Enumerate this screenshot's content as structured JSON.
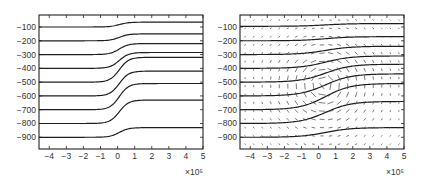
{
  "chart_data": [
    {
      "type": "line",
      "title": "",
      "xlabel": "",
      "ylabel": "",
      "x_exponent_label": "×10⁵",
      "xlim": [
        -4.6,
        5
      ],
      "ylim": [
        -985,
        -13
      ],
      "grid": false,
      "legend": null,
      "xticks": [
        -4,
        -3,
        -2,
        -1,
        0,
        1,
        2,
        3,
        4,
        5
      ],
      "xtick_labels": [
        "−4",
        "−3",
        "−2",
        "−1",
        "0",
        "1",
        "2",
        "3",
        "4",
        "5"
      ],
      "yticks": [
        -100,
        -200,
        -300,
        -400,
        -500,
        -600,
        -700,
        -800,
        -900
      ],
      "ytick_labels": [
        "−100",
        "−200",
        "−300",
        "−400",
        "−500",
        "−600",
        "−700",
        "−800",
        "−900"
      ],
      "transition": {
        "center": 0.1,
        "width": 0.55
      },
      "series": [
        {
          "name": "isopycnal 1",
          "left": -100,
          "right": -65
        },
        {
          "name": "isopycnal 2",
          "left": -200,
          "right": -150
        },
        {
          "name": "isopycnal 3",
          "left": -300,
          "right": -220
        },
        {
          "name": "isopycnal 4",
          "left": -400,
          "right": -285
        },
        {
          "name": "isopycnal 5",
          "left": -500,
          "right": -320
        },
        {
          "name": "isopycnal 6",
          "left": -600,
          "right": -420
        },
        {
          "name": "isopycnal 7",
          "left": -700,
          "right": -510
        },
        {
          "name": "isopycnal 8",
          "left": -800,
          "right": -630
        },
        {
          "name": "isopycnal 9",
          "left": -900,
          "right": -830
        }
      ]
    },
    {
      "type": "line",
      "title": "",
      "xlabel": "",
      "ylabel": "",
      "x_exponent_label": "×10⁵",
      "xlim": [
        -4.6,
        5
      ],
      "ylim": [
        -985,
        -13
      ],
      "grid": false,
      "legend": null,
      "xticks": [
        -4,
        -3,
        -2,
        -1,
        0,
        1,
        2,
        3,
        4,
        5
      ],
      "xtick_labels": [
        "−4",
        "−3",
        "−2",
        "−1",
        "0",
        "1",
        "2",
        "3",
        "4",
        "5"
      ],
      "yticks": [
        -100,
        -200,
        -300,
        -400,
        -500,
        -600,
        -700,
        -800,
        -900
      ],
      "ytick_labels": [
        "−100",
        "−200",
        "−300",
        "−400",
        "−500",
        "−600",
        "−700",
        "−800",
        "−900"
      ],
      "transition": {
        "center": 0.4,
        "width": 1.5
      },
      "series": [
        {
          "name": "isopycnal 1",
          "left": -95,
          "right": -75
        },
        {
          "name": "isopycnal 2",
          "left": -200,
          "right": -170
        },
        {
          "name": "isopycnal 3",
          "left": -300,
          "right": -240
        },
        {
          "name": "isopycnal 4",
          "left": -400,
          "right": -310
        },
        {
          "name": "isopycnal 5",
          "left": -500,
          "right": -370
        },
        {
          "name": "isopycnal 6",
          "left": -600,
          "right": -440
        },
        {
          "name": "isopycnal 7",
          "left": -700,
          "right": -510
        },
        {
          "name": "isopycnal 8",
          "left": -800,
          "right": -640
        },
        {
          "name": "isopycnal 9",
          "left": -900,
          "right": -830
        }
      ],
      "vector_field": {
        "type": "quiver",
        "description": "velocity arrows forming an anticyclonic/cyclonic eddy centred near x=0.3, y=-520",
        "center": [
          0.3,
          -520
        ],
        "radius_x": 2.6,
        "radius_y": 320,
        "grid_x": [
          -4.3,
          -3.8,
          -3.3,
          -2.8,
          -2.3,
          -1.8,
          -1.3,
          -0.8,
          -0.3,
          0.2,
          0.7,
          1.2,
          1.7,
          2.2,
          2.7,
          3.2,
          3.7,
          4.2,
          4.7
        ],
        "grid_y": [
          -50,
          -110,
          -170,
          -230,
          -290,
          -350,
          -410,
          -470,
          -530,
          -590,
          -650,
          -710,
          -770,
          -830,
          -890,
          -950
        ]
      }
    }
  ],
  "panels": [
    {
      "id": "left",
      "box": {
        "x": 39,
        "y": 15,
        "w": 164,
        "h": 134
      }
    },
    {
      "id": "right",
      "box": {
        "x": 240,
        "y": 15,
        "w": 164,
        "h": 134
      }
    }
  ]
}
